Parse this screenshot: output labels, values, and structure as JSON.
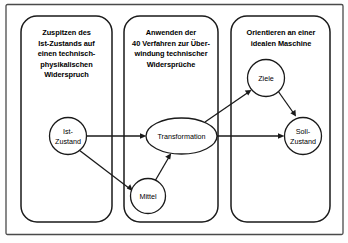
{
  "diagram": {
    "colors": {
      "frame_stroke": "#4a4a4a",
      "box_stroke": "#1a1a1a",
      "node_stroke": "#1a1a1a",
      "node_fill": "#ffffff",
      "edge_stroke": "#1a1a1a",
      "background": "#ffffff"
    },
    "phases": [
      {
        "id": "phase-1",
        "lines": [
          "Zuspitzen des",
          "Ist-Zustands auf",
          "einen technisch-",
          "physikalischen",
          "Widerspruch"
        ]
      },
      {
        "id": "phase-2",
        "lines": [
          "Anwenden der",
          "40 Verfahren zur Über-",
          "windung technischer",
          "Widersprüche"
        ]
      },
      {
        "id": "phase-3",
        "lines": [
          "Orientieren an einer",
          "idealen Maschine"
        ]
      }
    ],
    "nodes": [
      {
        "id": "ist-zustand",
        "lines": [
          "Ist-",
          "Zustand"
        ],
        "shape": "circle"
      },
      {
        "id": "mittel",
        "lines": [
          "Mittel"
        ],
        "shape": "circle"
      },
      {
        "id": "transformation",
        "lines": [
          "Transformation"
        ],
        "shape": "ellipse"
      },
      {
        "id": "ziele",
        "lines": [
          "Ziele"
        ],
        "shape": "circle"
      },
      {
        "id": "soll-zustand",
        "lines": [
          "Soll-",
          "Zustand"
        ],
        "shape": "circle"
      }
    ],
    "edges": [
      {
        "id": "edge-ist-to-transformation",
        "from": "ist-zustand",
        "to": "transformation"
      },
      {
        "id": "edge-ist-to-mittel",
        "from": "ist-zustand",
        "to": "mittel"
      },
      {
        "id": "edge-mittel-to-transformation",
        "from": "mittel",
        "to": "transformation"
      },
      {
        "id": "edge-transformation-to-ziele",
        "from": "transformation",
        "to": "ziele"
      },
      {
        "id": "edge-ziele-to-soll",
        "from": "ziele",
        "to": "soll-zustand"
      },
      {
        "id": "edge-transformation-to-soll",
        "from": "transformation",
        "to": "soll-zustand"
      }
    ]
  }
}
